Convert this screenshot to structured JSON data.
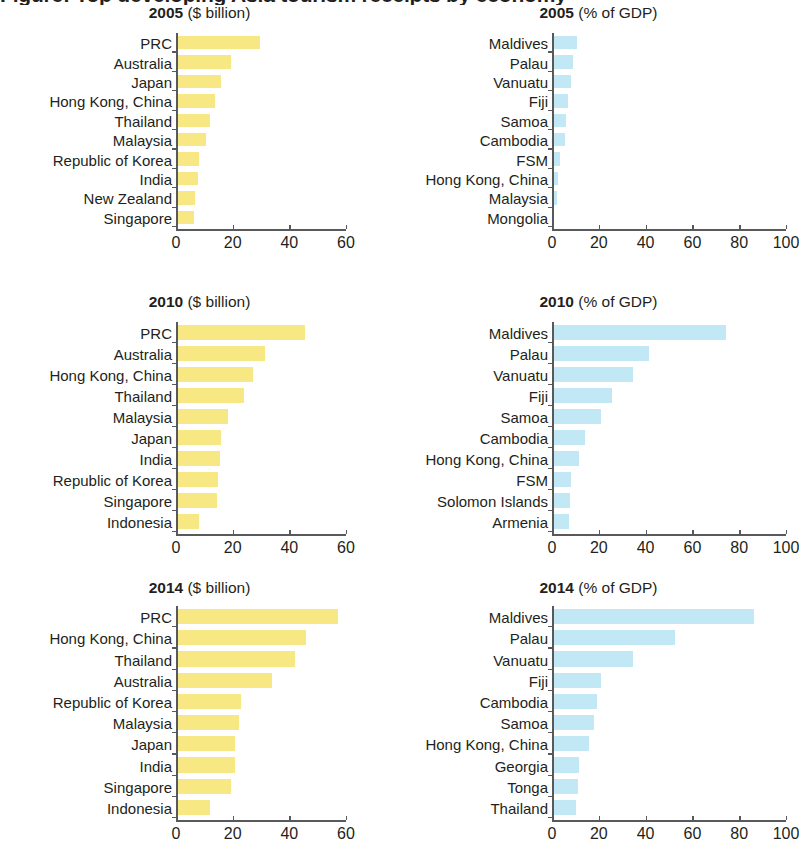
{
  "figure": {
    "main_title": "Figure: Top developing Asia tourism receipts by economy",
    "colors": {
      "yellow_bar": "#f8e884",
      "blue_bar": "#c2e8f6",
      "axis": "#58595b",
      "text": "#231f20"
    }
  },
  "chart_data": [
    {
      "type": "bar",
      "orientation": "horizontal",
      "title": "2005 ($ billion)",
      "year": "2005",
      "unit": "($ billion)",
      "series_color": "#f8e884",
      "xlabel": "",
      "ylabel": "",
      "xlim": [
        0,
        60
      ],
      "xticks": [
        0,
        20,
        40,
        60
      ],
      "grid": false,
      "legend": "none",
      "categories": [
        "PRC",
        "Australia",
        "Japan",
        "Hong Kong, China",
        "Thailand",
        "Malaysia",
        "Republic of Korea",
        "India",
        "New Zealand",
        "Singapore"
      ],
      "values": [
        29.3,
        19.1,
        15.4,
        13.5,
        11.8,
        10.4,
        7.8,
        7.3,
        6.3,
        6.1
      ]
    },
    {
      "type": "bar",
      "orientation": "horizontal",
      "title": "2005 (% of GDP)",
      "year": "2005",
      "unit": "(% of GDP)",
      "series_color": "#c2e8f6",
      "xlabel": "",
      "ylabel": "",
      "xlim": [
        0,
        100
      ],
      "xticks": [
        0,
        20,
        40,
        60,
        80,
        100
      ],
      "grid": false,
      "legend": "none",
      "categories": [
        "Maldives",
        "Palau",
        "Vanuatu",
        "Fiji",
        "Samoa",
        "Cambodia",
        "FSM",
        "Hong Kong, China",
        "Malaysia",
        "Mongolia"
      ],
      "values": [
        10.2,
        8.6,
        7.6,
        6.2,
        5.6,
        5.0,
        3.0,
        2.0,
        1.5,
        0.6
      ]
    },
    {
      "type": "bar",
      "orientation": "horizontal",
      "title": "2010 ($ billion)",
      "year": "2010",
      "unit": "($ billion)",
      "series_color": "#f8e884",
      "xlabel": "",
      "ylabel": "",
      "xlim": [
        0,
        60
      ],
      "xticks": [
        0,
        20,
        40,
        60
      ],
      "grid": false,
      "legend": "none",
      "categories": [
        "PRC",
        "Australia",
        "Hong Kong, China",
        "Thailand",
        "Malaysia",
        "Japan",
        "India",
        "Republic of Korea",
        "Singapore",
        "Indonesia"
      ],
      "values": [
        45.0,
        31.0,
        26.8,
        23.5,
        18.1,
        15.5,
        15.0,
        14.6,
        14.0,
        7.6
      ]
    },
    {
      "type": "bar",
      "orientation": "horizontal",
      "title": "2010 (% of GDP)",
      "year": "2010",
      "unit": "(% of GDP)",
      "series_color": "#c2e8f6",
      "xlabel": "",
      "ylabel": "",
      "xlim": [
        0,
        100
      ],
      "xticks": [
        0,
        20,
        40,
        60,
        80,
        100
      ],
      "grid": false,
      "legend": "none",
      "categories": [
        "Maldives",
        "Palau",
        "Vanuatu",
        "Fiji",
        "Samoa",
        "Cambodia",
        "Hong Kong, China",
        "FSM",
        "Solomon Islands",
        "Armenia"
      ],
      "values": [
        74.0,
        41.0,
        34.0,
        25.0,
        20.5,
        13.5,
        11.0,
        7.6,
        7.4,
        7.0
      ]
    },
    {
      "type": "bar",
      "orientation": "horizontal",
      "title": "2014 ($ billion)",
      "year": "2014",
      "unit": "($ billion)",
      "series_color": "#f8e884",
      "xlabel": "",
      "ylabel": "",
      "xlim": [
        0,
        60
      ],
      "xticks": [
        0,
        20,
        40,
        60
      ],
      "grid": false,
      "legend": "none",
      "categories": [
        "PRC",
        "Hong Kong, China",
        "Thailand",
        "Australia",
        "Republic of Korea",
        "Malaysia",
        "Japan",
        "India",
        "Singapore",
        "Indonesia"
      ],
      "values": [
        56.9,
        45.5,
        41.8,
        33.6,
        22.6,
        21.8,
        20.5,
        20.4,
        19.1,
        11.5
      ]
    },
    {
      "type": "bar",
      "orientation": "horizontal",
      "title": "2014 (% of GDP)",
      "year": "2014",
      "unit": "(% of GDP)",
      "series_color": "#c2e8f6",
      "xlabel": "",
      "ylabel": "",
      "xlim": [
        0,
        100
      ],
      "xticks": [
        0,
        20,
        40,
        60,
        80,
        100
      ],
      "grid": false,
      "legend": "none",
      "categories": [
        "Maldives",
        "Palau",
        "Vanuatu",
        "Fiji",
        "Cambodia",
        "Samoa",
        "Hong Kong, China",
        "Georgia",
        "Tonga",
        "Thailand"
      ],
      "values": [
        86.0,
        52.0,
        34.0,
        20.4,
        19.0,
        17.6,
        15.4,
        11.2,
        10.6,
        10.0
      ]
    }
  ]
}
